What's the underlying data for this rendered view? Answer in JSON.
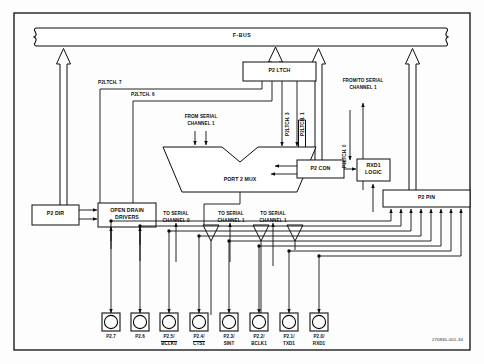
{
  "figure": {
    "bus_label": "F-BUS",
    "figure_id": "270830-001-34"
  },
  "blocks": [
    {
      "id": "p2ltch",
      "label": "P2 LTCH"
    },
    {
      "id": "p2mux",
      "label": "PORT 2 MUX"
    },
    {
      "id": "p2con",
      "label": "P2 CON"
    },
    {
      "id": "rxd1a",
      "label": "RXD1"
    },
    {
      "id": "rxd1b",
      "label": "LOGIC"
    },
    {
      "id": "p2dir",
      "label": "P2 DIR"
    },
    {
      "id": "oda",
      "label": "OPEN DRAIN"
    },
    {
      "id": "odb",
      "label": "DRIVERS"
    },
    {
      "id": "p2pin",
      "label": "P2 PIN"
    }
  ],
  "signals": {
    "ltch7": "P2LTCH. 7",
    "ltch6": "P2LTCH. 6",
    "ltch3": "P2LTCH. 3",
    "ltch1": "P2LTCH. 1",
    "ltch0": "P2LTCH. 0",
    "from_serial_1_a": "FROM SERIAL",
    "from_serial_1_b": "CHANNEL 1",
    "fromto_serial_a": "FROM/TO SERIAL",
    "fromto_serial_b": "CHANNEL 1",
    "to_serial_0_a": "TO SERIAL",
    "to_serial_0_b": "CHANNEL 0",
    "to_serial_1a_a": "TO SERIAL",
    "to_serial_1a_b": "CHANNEL 1",
    "to_serial_1b_a": "TO SERIAL",
    "to_serial_1b_b": "CHANNEL 1"
  },
  "pins": [
    {
      "name": "P2.7",
      "alt": "",
      "overline": false
    },
    {
      "name": "P2.6",
      "alt": "",
      "overline": false
    },
    {
      "name": "P2.5/",
      "alt": "BCLK0",
      "overline": true
    },
    {
      "name": "P2.4/",
      "alt": "CTS1",
      "overline": true
    },
    {
      "name": "P2.3/",
      "alt": "SINT",
      "overline": false
    },
    {
      "name": "P2.2/",
      "alt": "BCLK1",
      "overline": false
    },
    {
      "name": "P2.1/",
      "alt": "TXD1",
      "overline": false
    },
    {
      "name": "P2.0/",
      "alt": "RXD1",
      "overline": false
    }
  ],
  "colors": {
    "line": "#0d0d0d",
    "background": "#fdfdfd",
    "text": "#0d0d0d"
  }
}
